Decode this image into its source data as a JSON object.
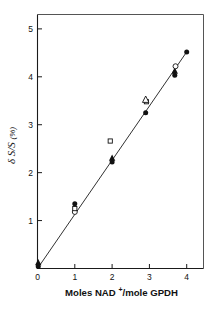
{
  "chart_data": {
    "type": "scatter",
    "title": "",
    "xlabel": "Moles NAD+/mole GPDH",
    "xlabel_main": "Moles NAD",
    "xlabel_sup": "+",
    "xlabel_tail": "/mole GPDH",
    "ylabel": "δ S/S (%)",
    "ylabel_symbol": "δ S/S",
    "ylabel_unit": "(%)",
    "xlim": [
      0,
      4.45
    ],
    "ylim": [
      0,
      5.3
    ],
    "xticks": [
      0,
      1,
      2,
      3,
      4
    ],
    "xticklabels": [
      "0",
      "1",
      "2",
      "3",
      "4"
    ],
    "yticks": [
      1,
      2,
      3,
      4,
      5
    ],
    "yticklabels": [
      "1",
      "2",
      "3",
      "4",
      "5"
    ],
    "grid": false,
    "legend": "none",
    "fit_line": {
      "x0": 0.0,
      "y0": 0.0,
      "x1": 4.0,
      "y1": 4.52,
      "slope": 1.13
    },
    "series": [
      {
        "name": "filled-circle",
        "marker": "filled-circle",
        "points": [
          {
            "x": 0.02,
            "y": 0.04
          },
          {
            "x": 1.0,
            "y": 1.35
          },
          {
            "x": 2.0,
            "y": 2.22
          },
          {
            "x": 2.9,
            "y": 3.25
          },
          {
            "x": 3.68,
            "y": 4.03
          },
          {
            "x": 4.0,
            "y": 4.52
          }
        ]
      },
      {
        "name": "filled-triangle",
        "marker": "filled-triangle",
        "points": [
          {
            "x": 0.02,
            "y": 0.12
          },
          {
            "x": 2.0,
            "y": 2.3
          },
          {
            "x": 3.68,
            "y": 4.12
          }
        ]
      },
      {
        "name": "open-circle",
        "marker": "open-circle",
        "points": [
          {
            "x": 1.0,
            "y": 1.18
          },
          {
            "x": 3.7,
            "y": 4.22
          }
        ]
      },
      {
        "name": "open-square",
        "marker": "open-square",
        "points": [
          {
            "x": 1.0,
            "y": 1.25
          },
          {
            "x": 1.95,
            "y": 2.66
          },
          {
            "x": 2.92,
            "y": 3.48
          }
        ]
      },
      {
        "name": "open-triangle",
        "marker": "open-triangle",
        "points": [
          {
            "x": 2.9,
            "y": 3.52
          }
        ]
      }
    ]
  }
}
